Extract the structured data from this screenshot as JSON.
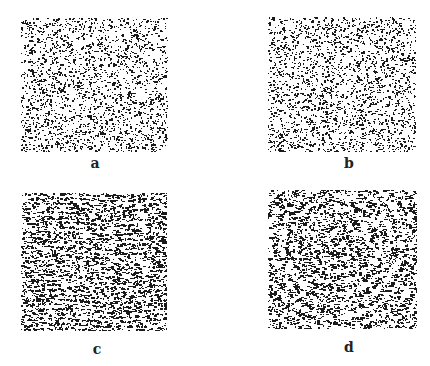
{
  "figure": {
    "panels": [
      {
        "id": "a",
        "label": "a",
        "x": 21,
        "y": 18,
        "w": 147,
        "h": 134,
        "density": 0.3,
        "pattern": "random-sparse",
        "label_x": 95,
        "label_y": 155
      },
      {
        "id": "b",
        "label": "b",
        "x": 268,
        "y": 17,
        "w": 148,
        "h": 135,
        "density": 0.32,
        "pattern": "random-sparse",
        "label_x": 349,
        "label_y": 155
      },
      {
        "id": "c",
        "label": "c",
        "x": 21,
        "y": 193,
        "w": 146,
        "h": 138,
        "density": 0.55,
        "pattern": "horizontal-streaks",
        "label_x": 97,
        "label_y": 341
      },
      {
        "id": "d",
        "label": "d",
        "x": 268,
        "y": 190,
        "w": 149,
        "h": 139,
        "density": 0.55,
        "pattern": "concentric-rings",
        "label_x": 349,
        "label_y": 339
      }
    ],
    "ink_color": "#1a1a1a",
    "background": "#ffffff"
  }
}
